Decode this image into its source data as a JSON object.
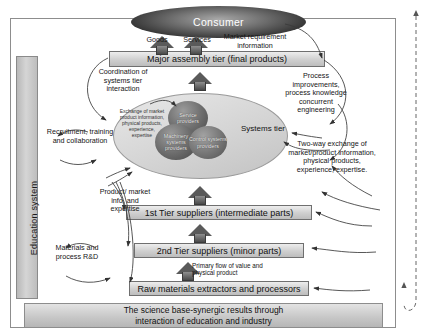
{
  "diagram": {
    "consumer": {
      "label": "Consumer"
    },
    "tiers": {
      "major_assembly": "Major assembly tier (final products)",
      "tier1": "1st Tier suppliers (intermediate parts)",
      "tier2": "2nd Tier suppliers (minor parts)",
      "raw_materials": "Raw materials extractors and processors"
    },
    "systems_tier": {
      "label": "Systems tier",
      "exchange_text": "Exchange of market product information, physical products, experience, expertise",
      "providers": [
        {
          "label": "Service providers"
        },
        {
          "label": "Machinery systems providers"
        },
        {
          "label": "Control systems providers"
        }
      ]
    },
    "education_system": {
      "label": "Education system"
    },
    "science_base": {
      "line1": "The science base-synergic results through",
      "line2": "interaction of education and industry"
    },
    "market_pull": {
      "label": "Market pull"
    },
    "flows": {
      "goods": "Goods",
      "services": "Services",
      "market_requirement": "Market requirement information",
      "coordination": "Coordination of systems tier interaction",
      "process_improvements": "Process improvements, process knowledge concurrent engineering",
      "two_way_exchange": "Two-way exchange of market/product information, physical products, experience, expertise.",
      "recruitment": "Recruitment, training and collaboration",
      "product_market_info": "Product/ market info. and expertise",
      "materials_rd": "Materials and process R&D",
      "primary_flow": "Primary flow of value and physical product"
    },
    "colors": {
      "frame_border": "#8d8d8d",
      "box_fill": "#cfcfcf",
      "consumer_fill": "#2e2e2e",
      "ellipse_fill": "#d2d2d2"
    }
  }
}
